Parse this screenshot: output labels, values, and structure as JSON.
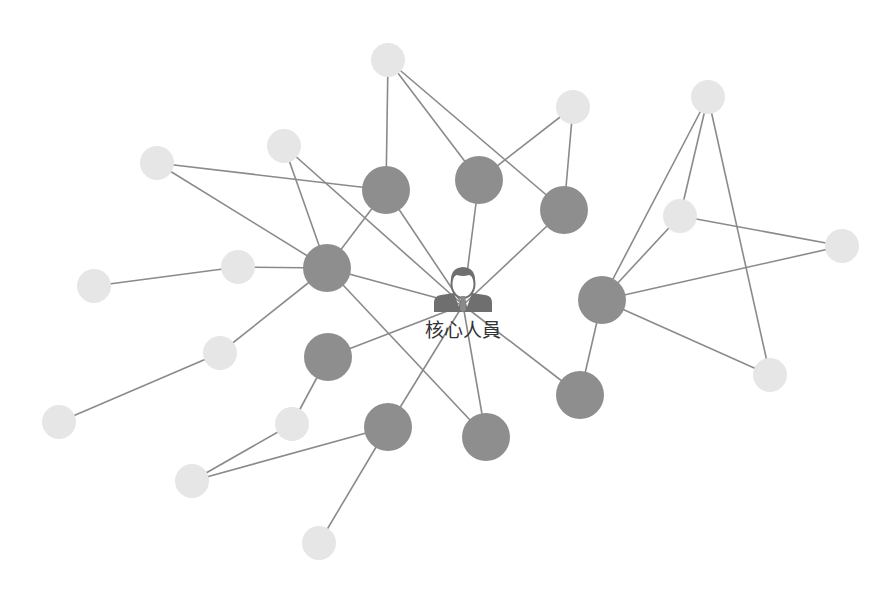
{
  "diagram": {
    "type": "network-graph",
    "center": {
      "label": "核心人員",
      "icon": "person-icon",
      "x": 463,
      "y": 310
    },
    "colors": {
      "edge": "#8a8a8a",
      "core_node": "#8e8e8e",
      "peripheral_node": "#e6e6e6",
      "icon": "#6f6f6f",
      "label": "#333333"
    },
    "nodes": [
      {
        "id": "D1",
        "kind": "core",
        "x": 386,
        "y": 190,
        "r": 24
      },
      {
        "id": "D2",
        "kind": "core",
        "x": 479,
        "y": 180,
        "r": 24
      },
      {
        "id": "D3",
        "kind": "core",
        "x": 564,
        "y": 210,
        "r": 24
      },
      {
        "id": "D4",
        "kind": "core",
        "x": 327,
        "y": 268,
        "r": 24
      },
      {
        "id": "D5",
        "kind": "core",
        "x": 602,
        "y": 300,
        "r": 24
      },
      {
        "id": "D6",
        "kind": "core",
        "x": 328,
        "y": 357,
        "r": 24
      },
      {
        "id": "D7",
        "kind": "core",
        "x": 388,
        "y": 427,
        "r": 24
      },
      {
        "id": "D8",
        "kind": "core",
        "x": 486,
        "y": 437,
        "r": 24
      },
      {
        "id": "D9",
        "kind": "core",
        "x": 580,
        "y": 395,
        "r": 24
      },
      {
        "id": "L1",
        "kind": "peripheral",
        "x": 388,
        "y": 60,
        "r": 17
      },
      {
        "id": "L2",
        "kind": "peripheral",
        "x": 573,
        "y": 107,
        "r": 17
      },
      {
        "id": "L3",
        "kind": "peripheral",
        "x": 284,
        "y": 146,
        "r": 17
      },
      {
        "id": "L4",
        "kind": "peripheral",
        "x": 157,
        "y": 163,
        "r": 17
      },
      {
        "id": "L5",
        "kind": "peripheral",
        "x": 238,
        "y": 267,
        "r": 17
      },
      {
        "id": "L6",
        "kind": "peripheral",
        "x": 94,
        "y": 286,
        "r": 17
      },
      {
        "id": "L7",
        "kind": "peripheral",
        "x": 220,
        "y": 353,
        "r": 17
      },
      {
        "id": "L8",
        "kind": "peripheral",
        "x": 59,
        "y": 422,
        "r": 17
      },
      {
        "id": "L9",
        "kind": "peripheral",
        "x": 292,
        "y": 424,
        "r": 17
      },
      {
        "id": "L10",
        "kind": "peripheral",
        "x": 192,
        "y": 481,
        "r": 17
      },
      {
        "id": "L11",
        "kind": "peripheral",
        "x": 319,
        "y": 543,
        "r": 17
      },
      {
        "id": "L12",
        "kind": "peripheral",
        "x": 708,
        "y": 97,
        "r": 17
      },
      {
        "id": "L13",
        "kind": "peripheral",
        "x": 680,
        "y": 216,
        "r": 17
      },
      {
        "id": "L14",
        "kind": "peripheral",
        "x": 842,
        "y": 246,
        "r": 17
      },
      {
        "id": "L15",
        "kind": "peripheral",
        "x": 770,
        "y": 375,
        "r": 17
      }
    ],
    "edges": [
      [
        "L1",
        "D1"
      ],
      [
        "L1",
        "D2"
      ],
      [
        "L1",
        "D3"
      ],
      [
        "L2",
        "D2"
      ],
      [
        "L2",
        "D3"
      ],
      [
        "L3",
        "D4"
      ],
      [
        "L3",
        "C"
      ],
      [
        "L4",
        "D1"
      ],
      [
        "L4",
        "D4"
      ],
      [
        "D1",
        "D4"
      ],
      [
        "D1",
        "C"
      ],
      [
        "D2",
        "C"
      ],
      [
        "D3",
        "C"
      ],
      [
        "L5",
        "D4"
      ],
      [
        "L6",
        "L5"
      ],
      [
        "D4",
        "L7"
      ],
      [
        "L7",
        "L8"
      ],
      [
        "D4",
        "C"
      ],
      [
        "D4",
        "D8"
      ],
      [
        "D6",
        "C"
      ],
      [
        "D6",
        "L9"
      ],
      [
        "L9",
        "L10"
      ],
      [
        "L10",
        "D7"
      ],
      [
        "D7",
        "C"
      ],
      [
        "D7",
        "L11"
      ],
      [
        "D8",
        "C"
      ],
      [
        "D9",
        "C"
      ],
      [
        "D5",
        "D9"
      ],
      [
        "D5",
        "L12"
      ],
      [
        "D5",
        "L13"
      ],
      [
        "D5",
        "L14"
      ],
      [
        "D5",
        "L15"
      ],
      [
        "L12",
        "L13"
      ],
      [
        "L12",
        "L15"
      ],
      [
        "L13",
        "L14"
      ]
    ]
  }
}
